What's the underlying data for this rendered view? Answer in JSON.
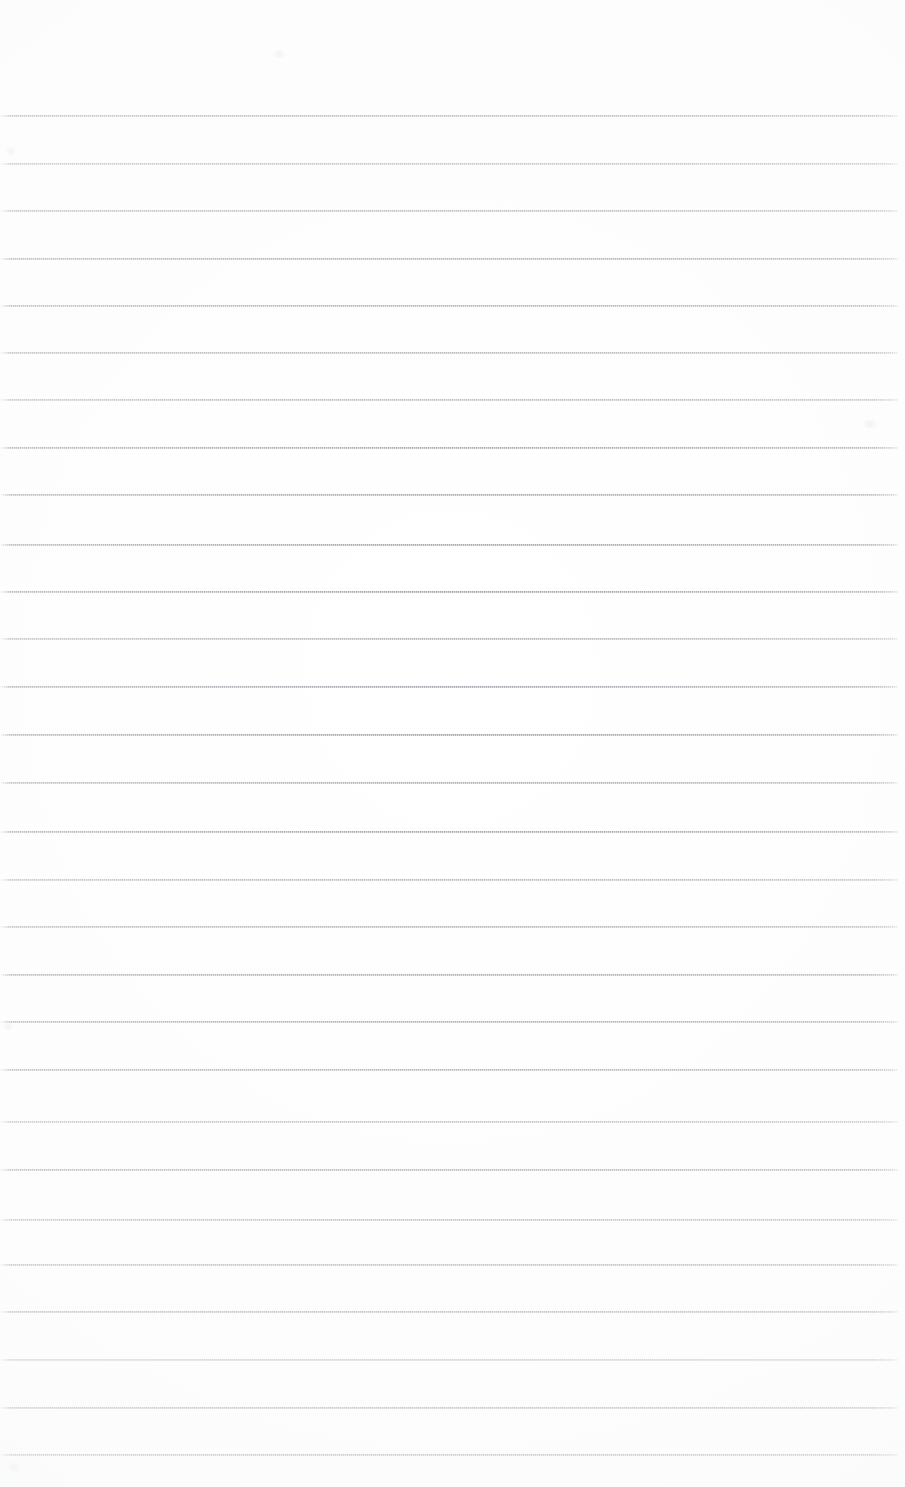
{
  "document": {
    "kind": "scanned-lined-paper",
    "title": "Blank ruled notebook page (scan)",
    "page_width": 905,
    "page_height": 1487,
    "background_color": "#ffffff",
    "line_color": "#7d838b",
    "line_thickness_px": 1,
    "line_spacing_px": 47.8,
    "line_left_x": 0,
    "line_right_x": 898,
    "first_line_y": 116,
    "last_line_y": 1455,
    "line_count": 29,
    "top_margin_px": 116,
    "bottom_margin_px": 32,
    "has_text_content": false,
    "has_margin_rule": false,
    "content_text": ""
  },
  "rules": {
    "y_positions": [
      116,
      164,
      211,
      259,
      306,
      353,
      400,
      448,
      495,
      545,
      592,
      639,
      687,
      735,
      783,
      832,
      880,
      927,
      975,
      1022,
      1070,
      1122,
      1170,
      1220,
      1265,
      1312,
      1360,
      1408,
      1455
    ]
  },
  "artifacts": {
    "smudges": [
      {
        "x": 4,
        "y": 146,
        "w": 14,
        "h": 10
      },
      {
        "x": 2,
        "y": 1020,
        "w": 12,
        "h": 12
      },
      {
        "x": 6,
        "y": 1462,
        "w": 16,
        "h": 10
      },
      {
        "x": 860,
        "y": 420,
        "w": 20,
        "h": 8
      },
      {
        "x": 270,
        "y": 50,
        "w": 18,
        "h": 8
      }
    ]
  }
}
